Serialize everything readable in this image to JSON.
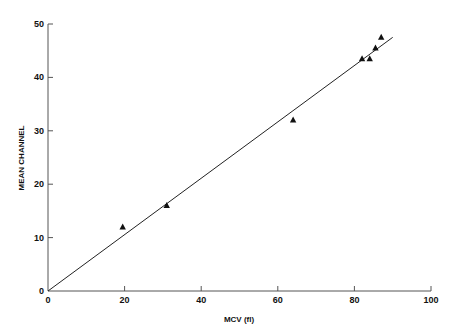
{
  "chart_data": {
    "type": "scatter",
    "title": "",
    "xlabel": "MCV (fl)",
    "ylabel": "MEAN CHANNEL",
    "xlim": [
      0,
      100
    ],
    "ylim": [
      0,
      50
    ],
    "xticks": [
      0,
      20,
      40,
      60,
      80,
      100
    ],
    "yticks": [
      0,
      10,
      20,
      30,
      40,
      50
    ],
    "grid": false,
    "legend": null,
    "marker": "triangle",
    "series": [
      {
        "name": "data",
        "points": [
          {
            "x": 19.5,
            "y": 12
          },
          {
            "x": 31,
            "y": 16
          },
          {
            "x": 64,
            "y": 32
          },
          {
            "x": 82,
            "y": 43.5
          },
          {
            "x": 84,
            "y": 43.5
          },
          {
            "x": 85.5,
            "y": 45.5
          },
          {
            "x": 87,
            "y": 47.5
          }
        ]
      }
    ],
    "fit_line": {
      "x1": 0,
      "y1": 0,
      "x2": 90,
      "y2": 47.5
    }
  }
}
